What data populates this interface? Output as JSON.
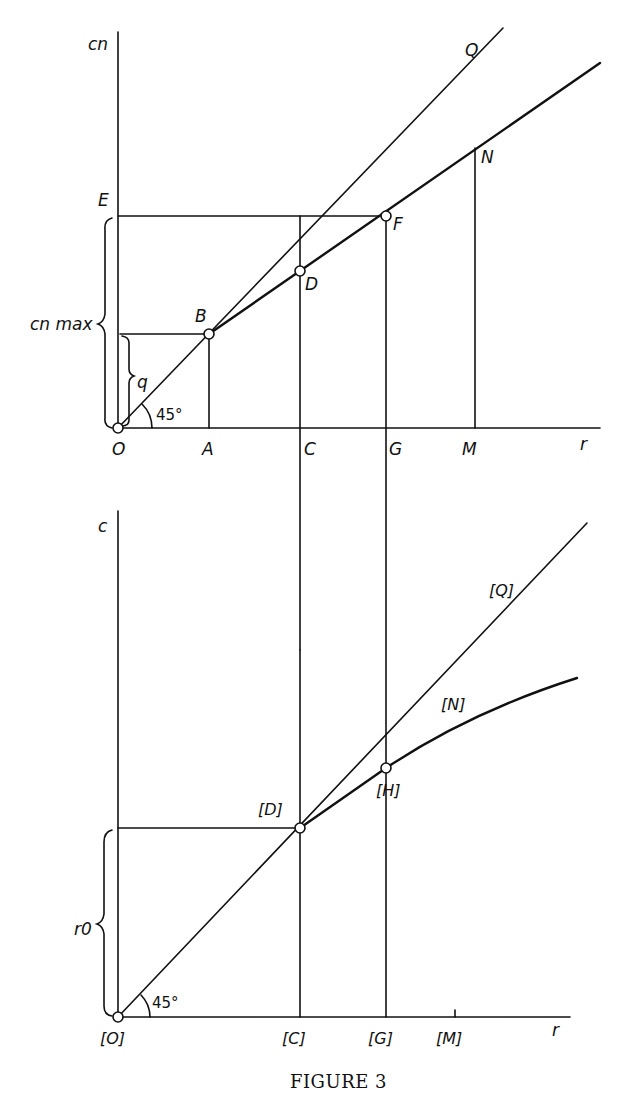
{
  "figure": {
    "caption": "FIGURE 3"
  },
  "top_diagram": {
    "y_axis_label": "cn",
    "x_axis_label": "r",
    "brace_labels": {
      "c_n_max": "cn max",
      "q": "q"
    },
    "angle_label": "45°",
    "points": {
      "E": "E",
      "B": "B",
      "D": "D",
      "F": "F",
      "N": "N",
      "Q": "Q",
      "O": "O",
      "A": "A",
      "C": "C",
      "G": "G",
      "M": "M"
    }
  },
  "bottom_diagram": {
    "y_axis_label": "c",
    "x_axis_label": "r",
    "brace_labels": {
      "r0": "r0"
    },
    "angle_label": "45°",
    "points": {
      "Q": "[Q]",
      "N": "[N]",
      "H": "[H]",
      "D": "[D]",
      "O": "[O]",
      "C": "[C]",
      "G": "[G]",
      "M": "[M]"
    }
  }
}
